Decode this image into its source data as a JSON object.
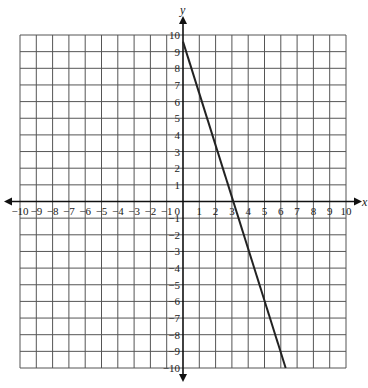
{
  "chart_data": {
    "type": "line",
    "title": "",
    "xlabel": "x",
    "ylabel": "y",
    "xlim": [
      -10,
      10
    ],
    "ylim": [
      -10,
      10
    ],
    "grid": true,
    "origin_label": "0",
    "x_ticks": [
      -10,
      -9,
      -8,
      -7,
      -6,
      -5,
      -4,
      -3,
      -2,
      -1,
      1,
      2,
      3,
      4,
      5,
      6,
      7,
      8,
      9,
      10
    ],
    "y_ticks": [
      10,
      9,
      8,
      7,
      6,
      5,
      4,
      3,
      2,
      1,
      -1,
      -2,
      -3,
      -4,
      -5,
      -6,
      -7,
      -8,
      -9,
      -10
    ],
    "series": [
      {
        "name": "line",
        "points": [
          [
            0,
            9.6
          ],
          [
            6.3,
            -10
          ]
        ],
        "color": "#222222"
      }
    ]
  }
}
